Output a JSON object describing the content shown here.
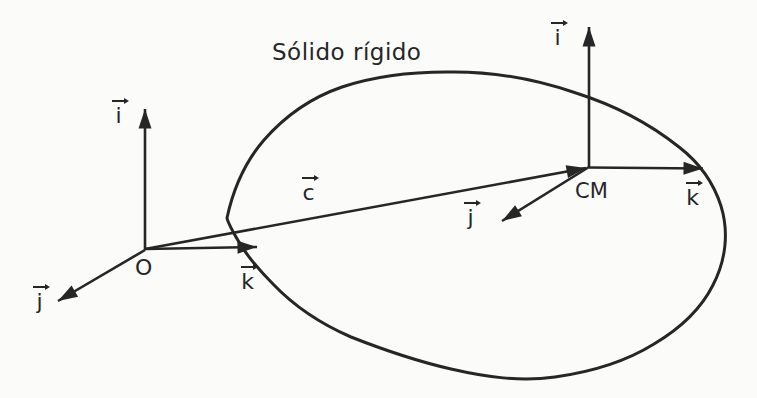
{
  "title": "Sólido rígido",
  "vector_c": {
    "label": "c"
  },
  "origin_frame": {
    "label": "O",
    "i_label": "i",
    "j_label": "j",
    "k_label": "k"
  },
  "cm_frame": {
    "label": "CM",
    "i_label": "i",
    "j_label": "j",
    "k_label": "k"
  },
  "colors": {
    "ink": "#262626",
    "paper": "#fbfbfa"
  }
}
